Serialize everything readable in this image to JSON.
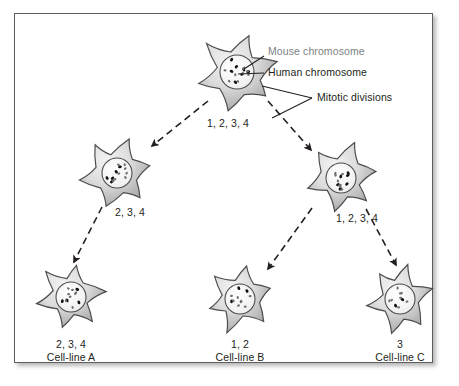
{
  "figure": {
    "border_color": "#5d5d5d",
    "background": "#ffffff"
  },
  "legend": {
    "mouse_label": "Mouse chromosome",
    "mouse_color": "#808285",
    "human_label": "Human chromosome",
    "human_color": "#231f20",
    "mitotic_label": "Mitotic divisions"
  },
  "cells": [
    {
      "id": "parent-hybrid-cell",
      "name": "hybrid-cell",
      "cx": 237,
      "cy": 72,
      "r": 40,
      "nucleus_r": 17,
      "mouse_dots": 9,
      "human_dots": 7
    },
    {
      "id": "mid-left-cell",
      "name": "daughter-cell-left",
      "cx": 117,
      "cy": 173,
      "r": 36,
      "nucleus_r": 15,
      "mouse_dots": 8,
      "human_dots": 5
    },
    {
      "id": "mid-right-cell",
      "name": "daughter-cell-right",
      "cx": 341,
      "cy": 178,
      "r": 36,
      "nucleus_r": 15,
      "mouse_dots": 8,
      "human_dots": 6
    },
    {
      "id": "bottom-left-cell",
      "name": "cell-line-a-cell",
      "cx": 71,
      "cy": 297,
      "r": 34,
      "nucleus_r": 15,
      "mouse_dots": 8,
      "human_dots": 4
    },
    {
      "id": "bottom-mid-cell",
      "name": "cell-line-b-cell",
      "cx": 240,
      "cy": 299,
      "r": 34,
      "nucleus_r": 15,
      "mouse_dots": 8,
      "human_dots": 3
    },
    {
      "id": "bottom-right-cell",
      "name": "cell-line-c-cell",
      "cx": 400,
      "cy": 299,
      "r": 34,
      "nucleus_r": 15,
      "mouse_dots": 8,
      "human_dots": 2
    }
  ],
  "arrow_labels": {
    "top": "1, 2, 3, 4",
    "left_branch": "2, 3, 4",
    "right_branch": "1, 2, 3, 4"
  },
  "outcomes": [
    {
      "chromosomes": "2, 3, 4",
      "name": "Cell-line A",
      "x": 71
    },
    {
      "chromosomes": "1, 2",
      "name": "Cell-line B",
      "x": 240
    },
    {
      "chromosomes": "3",
      "name": "Cell-line C",
      "x": 400
    }
  ]
}
